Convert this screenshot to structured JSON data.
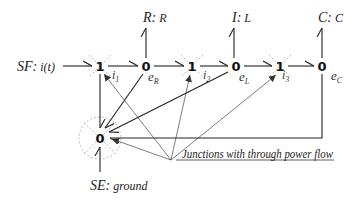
{
  "diagram": {
    "type": "bond-graph",
    "junctions": [
      {
        "id": "j1a",
        "label": "1",
        "x": 100,
        "y": 66,
        "through_power": true
      },
      {
        "id": "j0a",
        "label": "0",
        "x": 146,
        "y": 66,
        "through_power": false
      },
      {
        "id": "j1b",
        "label": "1",
        "x": 192,
        "y": 66,
        "through_power": true
      },
      {
        "id": "j0b",
        "label": "0",
        "x": 236,
        "y": 66,
        "through_power": false
      },
      {
        "id": "j1c",
        "label": "1",
        "x": 280,
        "y": 66,
        "through_power": true
      },
      {
        "id": "j0c",
        "label": "0",
        "x": 322,
        "y": 66,
        "through_power": false
      },
      {
        "id": "j0g",
        "label": "0",
        "x": 100,
        "y": 138,
        "through_power": true
      }
    ],
    "elements": {
      "source_flow": "SF: i(t)",
      "source_flow_name": "SF:",
      "source_flow_value": "i(t)",
      "resistor": "R: R",
      "resistor_name": "R:",
      "resistor_value": "R",
      "inductor": "I: L",
      "inductor_name": "I:",
      "inductor_value": "L",
      "capacitor": "C: C",
      "capacitor_name": "C:",
      "capacitor_value": "C",
      "ground_source": "SE: ground",
      "ground_name": "SE:",
      "ground_value": "ground"
    },
    "variables": {
      "i1": "i",
      "i1_sub": "1",
      "eR": "e",
      "eR_sub": "R",
      "i2": "i",
      "i2_sub": "2",
      "eL": "e",
      "eL_sub": "L",
      "i3": "i",
      "i3_sub": "3",
      "eC": "e",
      "eC_sub": "C"
    },
    "annotation": "Junctions with through power flow"
  }
}
